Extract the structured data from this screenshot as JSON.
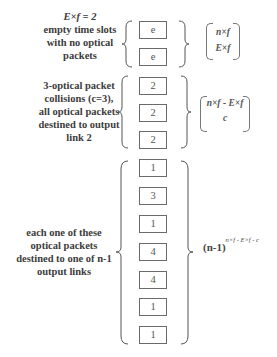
{
  "groups": [
    {
      "label_lines": [
        "E×f = 2",
        "empty time slots",
        "with no optical",
        "packets"
      ],
      "boxes": [
        "e",
        "e"
      ],
      "formula": {
        "type": "binomial",
        "top": "n×f",
        "bottom": "E×f"
      }
    },
    {
      "label_lines": [
        "3-optical packet",
        "collisions (c=3),",
        "all optical packets",
        "destined to output",
        "link 2"
      ],
      "boxes": [
        "2",
        "2",
        "2"
      ],
      "formula": {
        "type": "binomial",
        "top": "n×f - E×f",
        "bottom": "c"
      }
    },
    {
      "label_lines": [
        "each one of these",
        "optical packets",
        "destined to one of  n-1",
        "output links"
      ],
      "boxes": [
        "1",
        "3",
        "1",
        "4",
        "4",
        "1",
        "1"
      ],
      "formula": {
        "type": "power",
        "base": "(n-1)",
        "exponent": "n×f - E×f - c"
      }
    }
  ]
}
